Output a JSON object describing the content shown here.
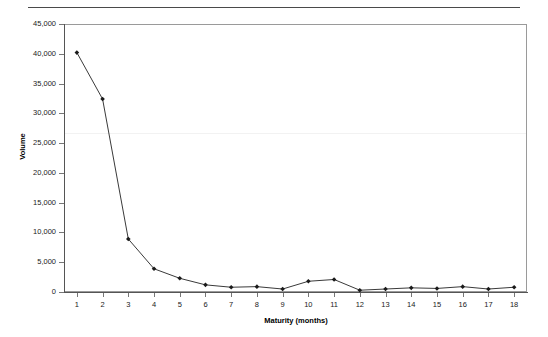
{
  "figure": {
    "top_divider_caption": ""
  },
  "chart_data": {
    "type": "line",
    "title": "",
    "subtitle": "",
    "xlabel": "Maturity (months)",
    "ylabel": "Volume",
    "categories": [
      1,
      2,
      3,
      4,
      5,
      6,
      7,
      8,
      9,
      10,
      11,
      12,
      13,
      14,
      15,
      16,
      17,
      18
    ],
    "x_tick_labels": [
      "1",
      "2",
      "3",
      "4",
      "5",
      "6",
      "7",
      "8",
      "9",
      "10",
      "11",
      "12",
      "13",
      "14",
      "15",
      "16",
      "17",
      "18"
    ],
    "values": [
      40200,
      32400,
      8900,
      3900,
      2300,
      1200,
      800,
      900,
      500,
      1800,
      2100,
      300,
      500,
      700,
      600,
      900,
      500,
      800
    ],
    "y_tick_values": [
      0,
      5000,
      10000,
      15000,
      20000,
      25000,
      30000,
      35000,
      40000,
      45000
    ],
    "y_tick_labels": [
      "0",
      "5,000",
      "10,000",
      "15,000",
      "20,000",
      "25,000",
      "30,000",
      "35,000",
      "40,000",
      "45,000"
    ],
    "ylim": [
      0,
      45000
    ],
    "xlim": [
      0.5,
      18.5
    ],
    "grid": false,
    "legend": false,
    "legend_position": "none",
    "marker": "diamond",
    "line_color": "#3a3a3a",
    "marker_color": "#1a1a1a",
    "frame_color": "#9a9a9a",
    "background_color": "#ffffff"
  }
}
